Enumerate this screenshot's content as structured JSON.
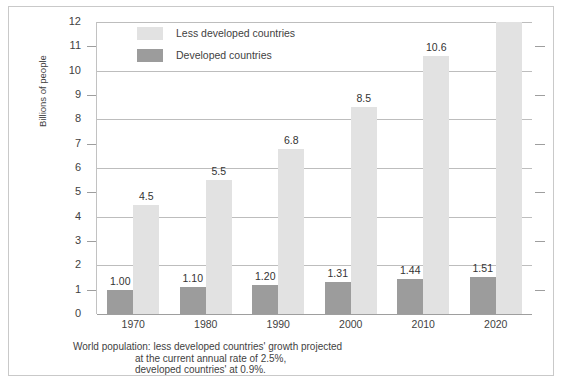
{
  "chart_data": {
    "type": "bar",
    "title": "",
    "subtitle": "",
    "xlabel": "",
    "ylabel": "Billions of people",
    "ylim": [
      0,
      12
    ],
    "yticks": [
      0,
      1,
      2,
      3,
      4,
      5,
      6,
      7,
      8,
      9,
      10,
      11,
      12
    ],
    "ytick_labels": [
      "0",
      "1",
      "2",
      "3",
      "4",
      "5",
      "6",
      "7",
      "8",
      "9",
      "10",
      "11",
      "12"
    ],
    "gridline_values": [
      0,
      2,
      4,
      6,
      8,
      10,
      12
    ],
    "tickmark_values": [
      1,
      3,
      5,
      7,
      9,
      11
    ],
    "grid": true,
    "legend_position": "top-left",
    "categories": [
      "1970",
      "1980",
      "1990",
      "2000",
      "2010",
      "2020"
    ],
    "series": [
      {
        "name": "Developed countries",
        "color": "#9c9c9c",
        "values": [
          1.0,
          1.1,
          1.2,
          1.31,
          1.44,
          1.51
        ],
        "labels": [
          "1.00",
          "1.10",
          "1.20",
          "1.31",
          "1.44",
          "1.51"
        ]
      },
      {
        "name": "Less developed countries",
        "color": "#e2e2e2",
        "values": [
          4.5,
          5.5,
          6.8,
          8.5,
          10.6,
          12.0
        ],
        "labels": [
          "4.5",
          "5.5",
          "6.8",
          "8.5",
          "10.6",
          ""
        ]
      }
    ],
    "caption": "World population: less developed countries' growth projected at the current annual rate of 2.5%, developed countries' at 0.9%."
  },
  "legend": {
    "items": [
      {
        "label": "Less developed countries",
        "swatch": "less"
      },
      {
        "label": "Developed countries",
        "swatch": "dev"
      }
    ]
  },
  "caption": {
    "line1": "World population: less developed countries' growth projected",
    "line2": "at the current annual rate of 2.5%,",
    "line3": "developed countries' at 0.9%."
  },
  "colors": {
    "developed": "#9c9c9c",
    "less_developed": "#e2e2e2",
    "grid": "#bdbdbd",
    "frame": "#c9c9c9",
    "text": "#3f3f3f"
  }
}
